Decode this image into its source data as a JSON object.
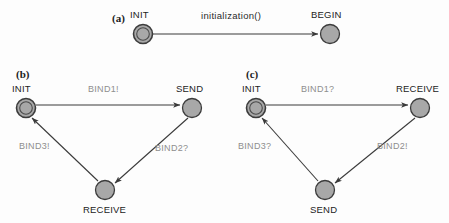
{
  "figure": {
    "background_color": "#fdfdfd",
    "node_fill_color": "#a8a8a8",
    "node_stroke_color": "#444444",
    "edge_color": "#3a3a3a",
    "edge_label_color": "#8e8e8e",
    "node_label_color": "#232323"
  },
  "panels": [
    {
      "tag": "(a)",
      "tag_pos": {
        "x": 112,
        "y": 12
      },
      "nodes": [
        {
          "id": "a-init",
          "name": "INIT",
          "shape": "double-circle",
          "cx": 143,
          "cy": 34,
          "r": 9.5,
          "label_pos": {
            "x": 130,
            "y": 9
          }
        },
        {
          "id": "a-begin",
          "name": "BEGIN",
          "shape": "circle",
          "cx": 330,
          "cy": 34,
          "r": 9.5,
          "label_pos": {
            "x": 311,
            "y": 9
          }
        }
      ],
      "edges": [
        {
          "from": "INIT",
          "to": "BEGIN",
          "label": "initialization()",
          "label_pos": {
            "x": 201,
            "y": 10
          },
          "style": "straight-arrow"
        }
      ]
    },
    {
      "tag": "(b)",
      "tag_pos": {
        "x": 16,
        "y": 68
      },
      "nodes": [
        {
          "id": "b-init",
          "name": "INIT",
          "shape": "double-circle",
          "cx": 26,
          "cy": 108,
          "r": 9.5,
          "label_pos": {
            "x": 12,
            "y": 83
          }
        },
        {
          "id": "b-send",
          "name": "SEND",
          "shape": "circle",
          "cx": 192,
          "cy": 108,
          "r": 9.5,
          "label_pos": {
            "x": 176,
            "y": 83
          }
        },
        {
          "id": "b-receive",
          "name": "RECEIVE",
          "shape": "circle",
          "cx": 105,
          "cy": 190,
          "r": 9.5,
          "label_pos": {
            "x": 83,
            "y": 204
          }
        }
      ],
      "edges": [
        {
          "from": "INIT",
          "to": "SEND",
          "label": "BIND1!",
          "label_pos": {
            "x": 88,
            "y": 84
          }
        },
        {
          "from": "SEND",
          "to": "RECEIVE",
          "label": "BIND2?",
          "label_pos": {
            "x": 155,
            "y": 143
          }
        },
        {
          "from": "RECEIVE",
          "to": "INIT",
          "label": "BIND3!",
          "label_pos": {
            "x": 19,
            "y": 141
          }
        }
      ]
    },
    {
      "tag": "(c)",
      "tag_pos": {
        "x": 246,
        "y": 68
      },
      "nodes": [
        {
          "id": "c-init",
          "name": "INIT",
          "shape": "double-circle",
          "cx": 256,
          "cy": 108,
          "r": 9.5,
          "label_pos": {
            "x": 242,
            "y": 83
          }
        },
        {
          "id": "c-receive",
          "name": "RECEIVE",
          "shape": "circle",
          "cx": 420,
          "cy": 108,
          "r": 9.5,
          "label_pos": {
            "x": 396,
            "y": 83
          }
        },
        {
          "id": "c-send",
          "name": "SEND",
          "shape": "circle",
          "cx": 325,
          "cy": 190,
          "r": 9.5,
          "label_pos": {
            "x": 310,
            "y": 204
          }
        }
      ],
      "edges": [
        {
          "from": "INIT",
          "to": "RECEIVE",
          "label": "BIND1?",
          "label_pos": {
            "x": 301,
            "y": 84
          }
        },
        {
          "from": "RECEIVE",
          "to": "SEND",
          "label": "BIND2!",
          "label_pos": {
            "x": 377,
            "y": 141
          }
        },
        {
          "from": "SEND",
          "to": "INIT",
          "label": "BIND3?",
          "label_pos": {
            "x": 238,
            "y": 141
          }
        }
      ]
    }
  ]
}
